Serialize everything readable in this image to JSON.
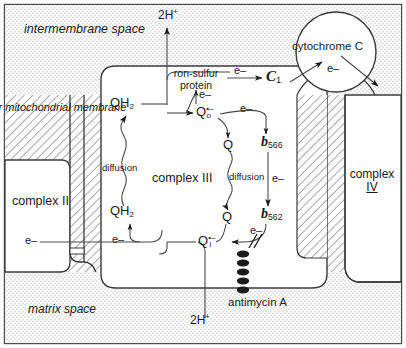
{
  "figure": {
    "colors": {
      "ink": "#1a1a1a",
      "stroke": "#333333",
      "intermembrane_fill": "#efefef",
      "matrix_fill": "#efefef",
      "membrane_fill": "#e6e6e6",
      "complex_fill": "#ffffff"
    }
  },
  "regions": {
    "intermembrane_space": "intermembrane space",
    "inner_mitochondrial_membrane": "inner mitochondrial membrane",
    "matrix_space": "matrix space"
  },
  "complexes": {
    "complex_ii": "complex II",
    "complex_iii": "complex III",
    "complex_iv_line1": "complex",
    "complex_iv_line2": "IV",
    "cytochrome_c": "cytochrome C"
  },
  "carriers": {
    "iron_sulfur_protein_line1": "ron-sulfur",
    "iron_sulfur_protein_line2": "protein",
    "c1_letter": "C",
    "c1_sub": "1",
    "qo_letter": "Q",
    "qo_sup": "•–",
    "qo_sub": "o",
    "qi_letter": "Q",
    "qi_sup": "•–",
    "qi_sub": "i",
    "q_top": "Q",
    "q_bottom": "Q",
    "qh2_top": "QH",
    "qh2_top_sub": "2",
    "qh2_bottom": "QH",
    "qh2_bottom_sub": "2",
    "b566_letter": "b",
    "b566_sub": "566",
    "b562_letter": "b",
    "b562_sub": "562"
  },
  "species": {
    "electron": "e–",
    "proton_top": "2H",
    "proton_top_sup": "+",
    "proton_bottom": "2H",
    "proton_bottom_sup": "+"
  },
  "annotations": {
    "diffusion_left": "diffusion",
    "diffusion_right": "diffusion",
    "antimycin": "antimycin A"
  },
  "electron_labels": [
    "e–",
    "e–",
    "e–",
    "e–",
    "e–",
    "e–",
    "e–",
    "e–",
    "e–",
    "e–"
  ]
}
